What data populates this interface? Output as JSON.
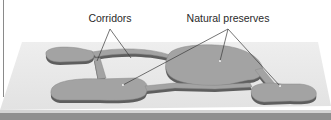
{
  "figure": {
    "labels": {
      "corridors": "Corridors",
      "natural_preserves": "Natural preserves"
    },
    "colors": {
      "background": "#ffffff",
      "slab_top": "#e9e9e9",
      "slab_edge": "#8c8c8c",
      "bottom_band": "#8f8f8f",
      "preserve_fill": "#a3a3a3",
      "preserve_shadow": "#5e5e5e",
      "leader_line": "#3a3a3a"
    },
    "elements": {
      "preserves": [
        "top-left preserve",
        "central preserve",
        "lower-left preserve",
        "lower-right preserve"
      ],
      "corridors": [
        "vertical corridor",
        "upper arc corridor",
        "lower corridor",
        "right corridor"
      ]
    }
  }
}
